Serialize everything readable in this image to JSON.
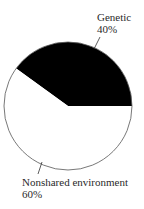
{
  "chart_data": {
    "type": "pie",
    "title": "",
    "slices": [
      {
        "label": "Genetic",
        "value": 40,
        "display": "40%",
        "color": "#000000"
      },
      {
        "label": "Nonshared environment",
        "value": 60,
        "display": "60%",
        "color": "#ffffff"
      }
    ],
    "start_angle_deg": 0,
    "direction": "counterclockwise",
    "outline_color": "#555555",
    "legend": "none (callout labels with leader lines)"
  },
  "labels": {
    "genetic": {
      "name": "Genetic",
      "pct": "40%"
    },
    "nonshared": {
      "name": "Nonshared environment",
      "pct": "60%"
    }
  }
}
